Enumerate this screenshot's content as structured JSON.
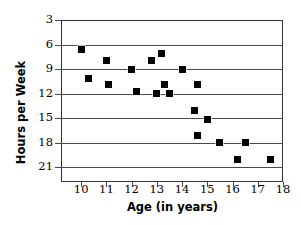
{
  "chart_data": {
    "type": "scatter",
    "title": "",
    "xlabel": "Age (in years)",
    "ylabel": "Hours per Week",
    "xlim": [
      9.2,
      18.0
    ],
    "ylim": [
      1.2,
      21.0
    ],
    "xticks": [
      10,
      11,
      12,
      13,
      14,
      15,
      16,
      17,
      18
    ],
    "yticks": [
      3,
      6,
      9,
      12,
      15,
      18,
      21
    ],
    "grid": "horizontal",
    "legend": "none",
    "marker": "square",
    "marker_color": "#000000",
    "points": [
      {
        "x": 10.0,
        "y": 17.4
      },
      {
        "x": 10.3,
        "y": 13.9
      },
      {
        "x": 11.0,
        "y": 16.1
      },
      {
        "x": 11.1,
        "y": 13.1
      },
      {
        "x": 12.0,
        "y": 15.0
      },
      {
        "x": 12.2,
        "y": 12.3
      },
      {
        "x": 12.8,
        "y": 16.1
      },
      {
        "x": 13.0,
        "y": 12.0
      },
      {
        "x": 13.2,
        "y": 16.9
      },
      {
        "x": 13.3,
        "y": 13.1
      },
      {
        "x": 13.5,
        "y": 12.0
      },
      {
        "x": 14.0,
        "y": 15.0
      },
      {
        "x": 14.5,
        "y": 10.0
      },
      {
        "x": 14.6,
        "y": 13.1
      },
      {
        "x": 14.6,
        "y": 6.9
      },
      {
        "x": 15.0,
        "y": 8.9
      },
      {
        "x": 15.5,
        "y": 6.0
      },
      {
        "x": 16.2,
        "y": 4.0
      },
      {
        "x": 16.5,
        "y": 6.0
      },
      {
        "x": 17.5,
        "y": 4.0
      }
    ]
  },
  "axes": {
    "x_title": "Age (in years)",
    "y_title": "Hours per Week",
    "x_tick_labels": [
      "10",
      "11",
      "12",
      "13",
      "14",
      "15",
      "16",
      "17",
      "18"
    ],
    "y_tick_labels": [
      "21",
      "18",
      "15",
      "12",
      "9",
      "6",
      "3"
    ]
  },
  "style": {
    "frame_color": "#333333",
    "grid_color": "#4a4a4a",
    "marker_color": "#000000",
    "background": "#ffffff"
  }
}
